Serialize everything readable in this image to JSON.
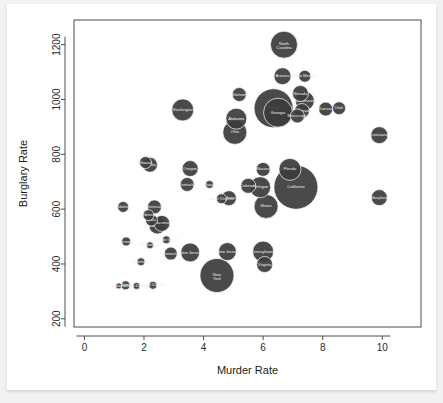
{
  "card": {
    "background_color": "#ffffff",
    "page_background_color": "#f2f2f2"
  },
  "chart_data": {
    "type": "scatter",
    "title": "",
    "subtitle": "",
    "xlabel": "Murder Rate",
    "ylabel": "Burglary Rate",
    "xlim": [
      -0.35,
      11.3
    ],
    "ylim": [
      170,
      1290
    ],
    "xticks": [
      0,
      2,
      4,
      6,
      8,
      10
    ],
    "xticklabels": [
      "0",
      "2",
      "4",
      "6",
      "8",
      "10"
    ],
    "yticks": [
      200,
      400,
      600,
      800,
      1000,
      1200
    ],
    "yticklabels": [
      "200",
      "400",
      "600",
      "800",
      "1000",
      "1200"
    ],
    "grid": false,
    "legend": false,
    "legend_position": "none",
    "marker_color": "#3c3c3c",
    "marker_edge_color": "#ffffff",
    "label_color": "#efefef",
    "size_encodes": "population",
    "points": [
      {
        "label": "North Carolina",
        "x": 6.7,
        "y": 1200,
        "r": 13.5
      },
      {
        "label": "Arizona",
        "x": 6.65,
        "y": 1085,
        "r": 8.5
      },
      {
        "label": "New Mexico",
        "x": 7.4,
        "y": 1085,
        "r": 6.0
      },
      {
        "label": "Nevada",
        "x": 7.25,
        "y": 1022,
        "r": 8.0
      },
      {
        "label": "Oklahoma",
        "x": 5.2,
        "y": 1018,
        "r": 7.0
      },
      {
        "label": "Tennessee",
        "x": 7.4,
        "y": 995,
        "r": 9.5
      },
      {
        "label": "Texas",
        "x": 6.35,
        "y": 968,
        "r": 19.5
      },
      {
        "label": "Georgia",
        "x": 6.5,
        "y": 952,
        "r": 14.5
      },
      {
        "label": "Washington",
        "x": 3.3,
        "y": 962,
        "r": 11.0
      },
      {
        "label": "Alabama",
        "x": 5.1,
        "y": 930,
        "r": 10.5
      },
      {
        "label": "Arkansas",
        "x": 7.3,
        "y": 958,
        "r": 7.5
      },
      {
        "label": "Mississippi",
        "x": 7.15,
        "y": 940,
        "r": 7.0
      },
      {
        "label": "Kansas",
        "x": 8.1,
        "y": 965,
        "r": 7.0
      },
      {
        "label": "Utah",
        "x": 8.55,
        "y": 968,
        "r": 6.5
      },
      {
        "label": "Ohio",
        "x": 5.05,
        "y": 880,
        "r": 12.0
      },
      {
        "label": "Louisiana",
        "x": 9.9,
        "y": 870,
        "r": 8.5
      },
      {
        "label": "Hawaii",
        "x": 2.05,
        "y": 770,
        "r": 6.0
      },
      {
        "label": "Alaska",
        "x": 2.2,
        "y": 762,
        "r": 7.5
      },
      {
        "label": "Oregon",
        "x": 3.55,
        "y": 748,
        "r": 8.0
      },
      {
        "label": "Kentucky",
        "x": 3.45,
        "y": 690,
        "r": 7.0
      },
      {
        "label": "Delaware",
        "x": 4.2,
        "y": 690,
        "r": 4.0
      },
      {
        "label": "West Virginia",
        "x": 4.6,
        "y": 638,
        "r": 5.0
      },
      {
        "label": "Indiana",
        "x": 4.85,
        "y": 640,
        "r": 7.5
      },
      {
        "label": "Colorado",
        "x": 5.5,
        "y": 685,
        "r": 7.5
      },
      {
        "label": "Michigan",
        "x": 5.9,
        "y": 680,
        "r": 10.5
      },
      {
        "label": "Missouri",
        "x": 6.0,
        "y": 745,
        "r": 7.0
      },
      {
        "label": "Florida",
        "x": 6.9,
        "y": 745,
        "r": 11.0
      },
      {
        "label": "California",
        "x": 7.1,
        "y": 680,
        "r": 22.0
      },
      {
        "label": "Illinois",
        "x": 6.1,
        "y": 610,
        "r": 12.0
      },
      {
        "label": "Maryland",
        "x": 9.9,
        "y": 642,
        "r": 8.0
      },
      {
        "label": "Idaho",
        "x": 1.3,
        "y": 608,
        "r": 5.5
      },
      {
        "label": "Minnesota",
        "x": 2.35,
        "y": 608,
        "r": 7.0
      },
      {
        "label": "Nebraska",
        "x": 2.15,
        "y": 578,
        "r": 5.5
      },
      {
        "label": "Iowa",
        "x": 2.25,
        "y": 560,
        "r": 6.0
      },
      {
        "label": "Wisconsin",
        "x": 2.6,
        "y": 548,
        "r": 8.0
      },
      {
        "label": "Massachusetts",
        "x": 2.45,
        "y": 540,
        "r": 8.5
      },
      {
        "label": "Rhode Island",
        "x": 2.75,
        "y": 488,
        "r": 4.0
      },
      {
        "label": "Vermont",
        "x": 1.4,
        "y": 482,
        "r": 4.5
      },
      {
        "label": "Wyoming",
        "x": 2.2,
        "y": 468,
        "r": 3.5
      },
      {
        "label": "Connecticut",
        "x": 2.9,
        "y": 438,
        "r": 6.5
      },
      {
        "label": "New Jersey",
        "x": 3.55,
        "y": 442,
        "r": 9.5
      },
      {
        "label": "New Jersey 2",
        "x": 4.8,
        "y": 445,
        "r": 9.0
      },
      {
        "label": "Pennsylvania",
        "x": 6.0,
        "y": 445,
        "r": 10.5
      },
      {
        "label": "Virginia",
        "x": 6.05,
        "y": 398,
        "r": 8.0
      },
      {
        "label": "Montana",
        "x": 1.9,
        "y": 408,
        "r": 4.0
      },
      {
        "label": "New York",
        "x": 4.45,
        "y": 358,
        "r": 17.0
      },
      {
        "label": "Indiana 2",
        "x": 1.15,
        "y": 320,
        "r": 3.0
      },
      {
        "label": "Maine",
        "x": 1.38,
        "y": 322,
        "r": 4.5
      },
      {
        "label": "North Dakota",
        "x": 1.75,
        "y": 320,
        "r": 3.5
      },
      {
        "label": "South Dakota",
        "x": 2.3,
        "y": 322,
        "r": 4.0
      }
    ]
  }
}
